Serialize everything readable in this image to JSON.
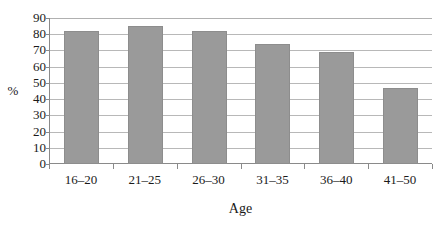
{
  "chart_data": {
    "type": "bar",
    "title": "",
    "subtitle": "",
    "categories": [
      "16–20",
      "21–25",
      "26–30",
      "31–35",
      "36–40",
      "41–50"
    ],
    "values": [
      82,
      85,
      82,
      74,
      69,
      47
    ],
    "xlabel": "Age",
    "ylabel": "%",
    "ylim": [
      0,
      90
    ],
    "ytick_step": 10,
    "yticks": [
      0,
      10,
      20,
      30,
      40,
      50,
      60,
      70,
      80,
      90
    ],
    "ytick_labels": [
      "0",
      "10",
      "20",
      "30",
      "40",
      "50",
      "60",
      "70",
      "80",
      "90"
    ],
    "grid": true,
    "grid_axis": "y",
    "legend": false,
    "legend_position": "none",
    "bar_color": "#9a9a9a",
    "bar_border_color": "#8d8d8d",
    "gridline_color": "#b8b8b8",
    "axis_color": "#8a8a8a",
    "series": [
      {
        "name": "%",
        "values": [
          82,
          85,
          82,
          74,
          69,
          47
        ]
      }
    ]
  }
}
